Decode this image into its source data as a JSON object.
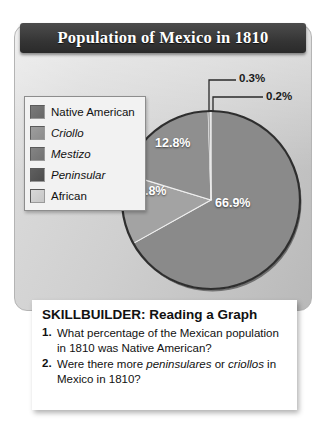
{
  "title": "Population of Mexico in 1810",
  "legend": {
    "items": [
      {
        "label": "Native American",
        "color": "#7a7a7a",
        "italic": false
      },
      {
        "label": "Criollo",
        "color": "#9e9e9e",
        "italic": true
      },
      {
        "label": "Mestizo",
        "color": "#848484",
        "italic": true
      },
      {
        "label": "Peninsular",
        "color": "#5f5f5f",
        "italic": true
      },
      {
        "label": "African",
        "color": "#d8d8d8",
        "italic": false
      }
    ]
  },
  "chart_data": {
    "type": "pie",
    "title": "Population of Mexico in 1810",
    "unit": "%",
    "categories": [
      "Native American",
      "Criollo",
      "Mestizo",
      "Peninsular",
      "African"
    ],
    "values": [
      66.9,
      12.8,
      19.8,
      0.3,
      0.2
    ],
    "colors": [
      "#8a8a8a",
      "#a3a3a3",
      "#8f8f8f",
      "#5a5a5a",
      "#e0e0e0"
    ],
    "labels": [
      "66.9%",
      "12.8%",
      "19.8%",
      "0.3%",
      "0.2%"
    ],
    "legend_position": "left",
    "grid": false,
    "callouts": [
      "0.3%",
      "0.2%"
    ]
  },
  "pie_labels": {
    "native_american": "66.9%",
    "mestizo": "19.8%",
    "criollo": "12.8%",
    "peninsular": "0.3%",
    "african": "0.2%"
  },
  "skillbuilder": {
    "heading": "SKILLBUILDER: Reading a Graph",
    "questions": [
      {
        "number": "1.",
        "parts": [
          {
            "text": "What percentage of the Mexican population in 1810 was Native American?",
            "italic": false
          }
        ]
      },
      {
        "number": "2.",
        "parts": [
          {
            "text": "Were there more ",
            "italic": false
          },
          {
            "text": "peninsulares",
            "italic": true
          },
          {
            "text": " or ",
            "italic": false
          },
          {
            "text": "criollos",
            "italic": true
          },
          {
            "text": " in Mexico in 1810?",
            "italic": false
          }
        ]
      }
    ]
  }
}
